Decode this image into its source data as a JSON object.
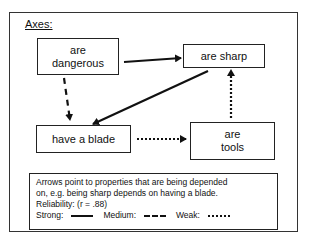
{
  "diagram": {
    "title": "Axes:",
    "nodes": [
      {
        "id": "dangerous",
        "label_line1": "are",
        "label_line2": "dangerous"
      },
      {
        "id": "sharp",
        "label": "are sharp"
      },
      {
        "id": "blade",
        "label": "have a blade"
      },
      {
        "id": "tools",
        "label_line1": "are",
        "label_line2": "tools"
      }
    ],
    "edges": [
      {
        "from": "dangerous",
        "to": "sharp",
        "strength": "strong"
      },
      {
        "from": "sharp",
        "to": "blade",
        "strength": "strong"
      },
      {
        "from": "dangerous",
        "to": "blade",
        "strength": "medium"
      },
      {
        "from": "blade",
        "to": "tools",
        "strength": "weak"
      },
      {
        "from": "tools",
        "to": "sharp",
        "strength": "weak"
      }
    ],
    "legend": {
      "line1": "Arrows point to properties that are being depended",
      "line2": "on, e.g. being sharp depends on having a blade.",
      "reliability": "Reliability: (r = .88)",
      "strong": "Strong:",
      "medium": "Medium:",
      "weak": "Weak:"
    }
  }
}
